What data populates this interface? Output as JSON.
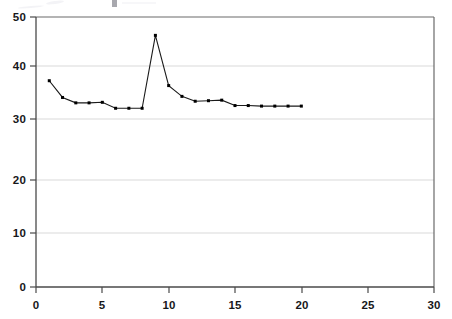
{
  "chart_data": {
    "type": "line",
    "title": "",
    "subtitle": "",
    "xlabel": "",
    "ylabel": "",
    "x": [
      1,
      2,
      3,
      4,
      5,
      6,
      7,
      8,
      9,
      10,
      11,
      12,
      13,
      14,
      15,
      16,
      17,
      18,
      19,
      20
    ],
    "values": [
      38.2,
      35.1,
      34.1,
      34.1,
      34.2,
      33.1,
      33.1,
      33.1,
      46.6,
      37.3,
      35.3,
      34.4,
      34.5,
      34.6,
      33.6,
      33.6,
      33.5,
      33.5,
      33.5,
      33.5
    ],
    "series": [
      {
        "name": "series-1",
        "values": [
          38.2,
          35.1,
          34.1,
          34.1,
          34.2,
          33.1,
          33.1,
          33.1,
          46.6,
          37.3,
          35.3,
          34.4,
          34.5,
          34.6,
          33.6,
          33.6,
          33.5,
          33.5,
          33.5,
          33.5
        ]
      }
    ],
    "xlim": [
      0,
      30
    ],
    "ylim": [
      0,
      50
    ],
    "xticks": [
      0,
      5,
      10,
      15,
      20,
      25,
      30
    ],
    "yticks": [
      0,
      10,
      20,
      30,
      40,
      50
    ],
    "xtick_labels": [
      "0",
      "5",
      "10",
      "15",
      "20",
      "25",
      "30"
    ],
    "ytick_labels": [
      "0",
      "10",
      "20",
      "30",
      "40",
      "50"
    ],
    "grid": {
      "horizontal": true,
      "vertical": false,
      "color": "#d9d9d9"
    },
    "legend": {
      "show": false,
      "position": "none",
      "entries": []
    },
    "style": {
      "line_color": "#1a1a1a",
      "marker_color": "#000000",
      "marker_shape": "square",
      "marker_size": 3,
      "line_width": 1.1,
      "axis_color": "#555555",
      "background": "#ffffff",
      "plot_background": "#ffffff"
    },
    "annotations": [
      {
        "name": "peak",
        "x": 9,
        "y": 46.6
      }
    ]
  },
  "axes": {
    "y_tick_0": "0",
    "y_tick_1": "10",
    "y_tick_2": "20",
    "y_tick_3": "30",
    "y_tick_4": "40",
    "y_tick_5": "50",
    "x_tick_0": "0",
    "x_tick_1": "5",
    "x_tick_2": "10",
    "x_tick_3": "15",
    "x_tick_4": "20",
    "x_tick_5": "25",
    "x_tick_6": "30"
  }
}
